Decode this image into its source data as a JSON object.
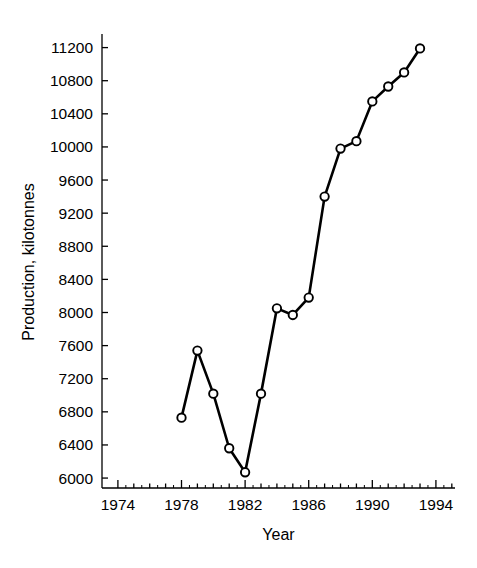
{
  "chart_data": {
    "type": "line",
    "title": "",
    "xlabel": "Year",
    "ylabel": "Production, kilotonnes",
    "xlim": [
      1973.0,
      1995.2
    ],
    "ylim": [
      5880,
      11340
    ],
    "grid": false,
    "legend": null,
    "marker": "open-circle",
    "line_color": "#000000",
    "marker_face_color": "#ffffff",
    "marker_edge_color": "#000000",
    "x_major_ticks": [
      1974,
      1978,
      1982,
      1986,
      1990,
      1994
    ],
    "x_tick_labels": [
      "1974",
      "1978",
      "1982",
      "1986",
      "1990",
      "1994"
    ],
    "x_minor_tick_step": 1,
    "y_major_ticks": [
      6000,
      6400,
      6800,
      7200,
      7600,
      8000,
      8400,
      8800,
      9200,
      9600,
      10000,
      10400,
      10800,
      11200
    ],
    "y_tick_labels": [
      "6000",
      "6400",
      "6800",
      "7200",
      "7600",
      "8000",
      "8400",
      "8800",
      "9200",
      "9600",
      "10000",
      "10400",
      "10800",
      "11200"
    ],
    "x": [
      1978,
      1979,
      1980,
      1981,
      1982,
      1983,
      1984,
      1985,
      1986,
      1987,
      1988,
      1989,
      1990,
      1991,
      1992,
      1993
    ],
    "values": [
      6730,
      7540,
      7020,
      6360,
      6070,
      7020,
      8050,
      7970,
      8180,
      9400,
      9980,
      10070,
      10550,
      10730,
      10900,
      11190
    ],
    "series": [
      {
        "name": "Production",
        "values": [
          6730,
          7540,
          7020,
          6360,
          6070,
          7020,
          8050,
          7970,
          8180,
          9400,
          9980,
          10070,
          10550,
          10730,
          10900,
          11190
        ]
      }
    ]
  }
}
